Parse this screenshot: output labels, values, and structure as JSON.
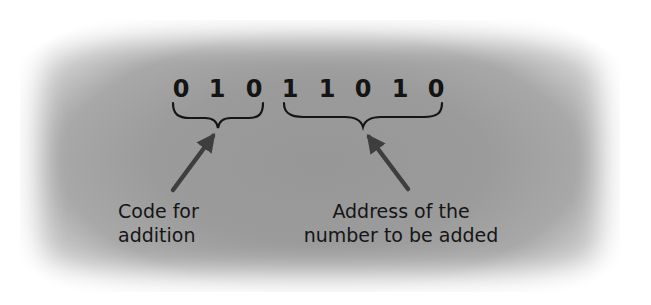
{
  "diagram": {
    "instruction_bits": [
      "0",
      "1",
      "0",
      "1",
      "1",
      "0",
      "1",
      "0"
    ],
    "groups": [
      {
        "name": "opcode",
        "bits_range": [
          0,
          2
        ],
        "bits": "010",
        "label_lines": [
          "Code for",
          "addition"
        ]
      },
      {
        "name": "operand-address",
        "bits_range": [
          3,
          7
        ],
        "bits": "11010",
        "label_lines": [
          "Address of the",
          "number to be added"
        ]
      }
    ],
    "colors": {
      "background_center": "#9a9a9a",
      "text": "#151515",
      "arrow": "#3e3e3e",
      "page": "#ffffff"
    },
    "icons": {
      "brace": "curly-brace-under",
      "arrow": "arrow-up-pointer"
    }
  }
}
